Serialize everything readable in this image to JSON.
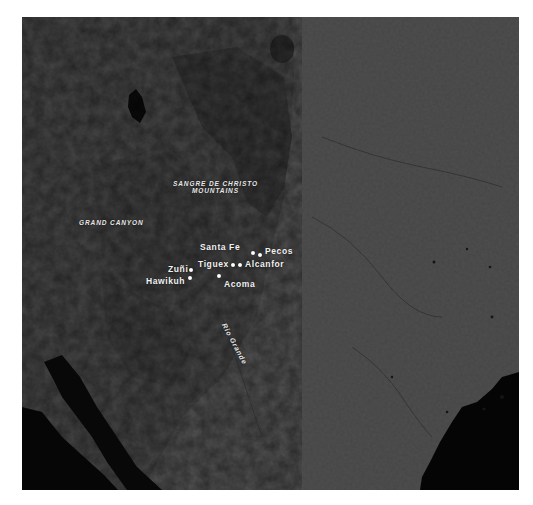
{
  "map": {
    "type": "shaded-relief",
    "colors": {
      "land": "#4d4d4d",
      "land_dark": "#3a3a3a",
      "mountains": "#2e2e2e",
      "water": "#050505",
      "labels": "#f2f2f2"
    },
    "regions": [
      {
        "id": "sangre-de-christo",
        "lines": [
          "SANGRE DE CHRISTO",
          "MOUNTAINS"
        ]
      },
      {
        "id": "grand-canyon",
        "lines": [
          "GRAND CANYON"
        ]
      }
    ],
    "rivers": [
      {
        "id": "rio-grande",
        "label": "Rio Grande"
      }
    ],
    "places": [
      {
        "id": "santa-fe",
        "label": "Santa Fe"
      },
      {
        "id": "pecos",
        "label": "Pecos"
      },
      {
        "id": "tiguex",
        "label": "Tiguex"
      },
      {
        "id": "alcanfor",
        "label": "Alcanfor"
      },
      {
        "id": "zuni",
        "label": "Zuñi"
      },
      {
        "id": "hawikuh",
        "label": "Hawikuh"
      },
      {
        "id": "acoma",
        "label": "Acoma"
      }
    ]
  }
}
